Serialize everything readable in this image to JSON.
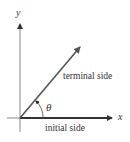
{
  "diagram": {
    "type": "angle-in-standard-position",
    "axes": {
      "x_label": "x",
      "y_label": "y"
    },
    "angle_label": "θ",
    "rays": [
      {
        "name": "terminal side",
        "label": "terminal side"
      },
      {
        "name": "initial side",
        "label": "initial side"
      }
    ],
    "colors": {
      "axis": "#888888",
      "ray": "#555555",
      "initial_side": "#333333",
      "text": "#333333"
    }
  }
}
